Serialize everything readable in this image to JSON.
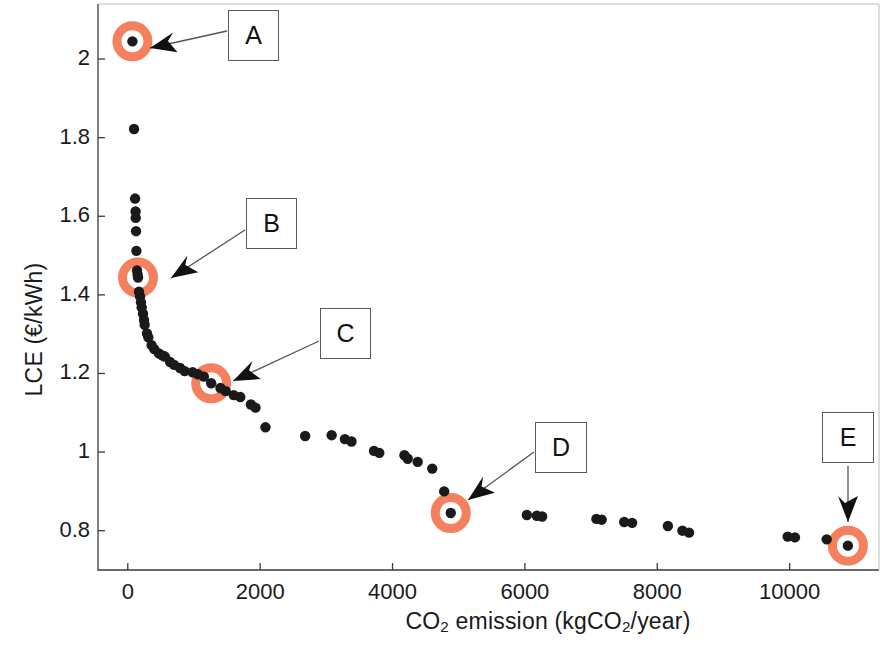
{
  "chart_data": {
    "type": "scatter",
    "title": "",
    "xlabel": "CO2 emission (kgCO2/year)",
    "ylabel": "LCE (€/kWh)",
    "xlabel_parts": {
      "pre": "CO",
      "sub1": "2",
      "mid": " emission (kgCO",
      "sub2": "2",
      "post": "/year)"
    },
    "ylabel_text": "LCE (€/kWh)",
    "xlim": [
      -450,
      11350
    ],
    "ylim": [
      0.7,
      2.14
    ],
    "xticks": [
      0,
      2000,
      4000,
      6000,
      8000,
      10000
    ],
    "xticklabels": [
      "0",
      "2000",
      "4000",
      "6000",
      "8000",
      "10000"
    ],
    "yticks": [
      0.8,
      1.0,
      1.2,
      1.4,
      1.6,
      1.8,
      2.0
    ],
    "yticklabels": [
      "0.8",
      "1",
      "1.2",
      "1.4",
      "1.6",
      "1.8",
      "2"
    ],
    "grid": false,
    "marker_color": "#1a1a1a",
    "highlight_color": "#F4805E",
    "legend": null,
    "series": [
      {
        "name": "Pareto front solutions",
        "marker": "filled-circle",
        "color": "#1a1a1a",
        "points": [
          [
            70,
            2.045
          ],
          [
            95,
            1.822
          ],
          [
            110,
            1.645
          ],
          [
            118,
            1.612
          ],
          [
            120,
            1.596
          ],
          [
            125,
            1.562
          ],
          [
            130,
            1.512
          ],
          [
            140,
            1.462
          ],
          [
            148,
            1.452
          ],
          [
            155,
            1.444
          ],
          [
            170,
            1.408
          ],
          [
            185,
            1.396
          ],
          [
            200,
            1.381
          ],
          [
            210,
            1.368
          ],
          [
            230,
            1.352
          ],
          [
            245,
            1.336
          ],
          [
            255,
            1.324
          ],
          [
            290,
            1.302
          ],
          [
            310,
            1.292
          ],
          [
            360,
            1.272
          ],
          [
            400,
            1.262
          ],
          [
            470,
            1.251
          ],
          [
            520,
            1.246
          ],
          [
            560,
            1.243
          ],
          [
            640,
            1.229
          ],
          [
            700,
            1.222
          ],
          [
            790,
            1.214
          ],
          [
            860,
            1.206
          ],
          [
            980,
            1.203
          ],
          [
            1060,
            1.198
          ],
          [
            1150,
            1.192
          ],
          [
            1260,
            1.175
          ],
          [
            1400,
            1.163
          ],
          [
            1480,
            1.155
          ],
          [
            1600,
            1.145
          ],
          [
            1700,
            1.14
          ],
          [
            1860,
            1.121
          ],
          [
            1930,
            1.113
          ],
          [
            2080,
            1.063
          ],
          [
            2680,
            1.041
          ],
          [
            3080,
            1.043
          ],
          [
            3280,
            1.033
          ],
          [
            3380,
            1.027
          ],
          [
            3720,
            1.003
          ],
          [
            3800,
            0.998
          ],
          [
            4180,
            0.992
          ],
          [
            4230,
            0.983
          ],
          [
            4380,
            0.975
          ],
          [
            4600,
            0.958
          ],
          [
            4780,
            0.9
          ],
          [
            4880,
            0.845
          ],
          [
            6030,
            0.84
          ],
          [
            6180,
            0.838
          ],
          [
            6260,
            0.836
          ],
          [
            7080,
            0.83
          ],
          [
            7160,
            0.828
          ],
          [
            7500,
            0.822
          ],
          [
            7620,
            0.82
          ],
          [
            8160,
            0.812
          ],
          [
            8380,
            0.8
          ],
          [
            8480,
            0.795
          ],
          [
            9970,
            0.785
          ],
          [
            10080,
            0.783
          ],
          [
            10560,
            0.778
          ],
          [
            10880,
            0.762
          ]
        ]
      }
    ],
    "highlighted_points": [
      {
        "label": "A",
        "x": 70,
        "y": 2.045
      },
      {
        "label": "B",
        "x": 155,
        "y": 1.444
      },
      {
        "label": "C",
        "x": 1260,
        "y": 1.175
      },
      {
        "label": "D",
        "x": 4880,
        "y": 0.845
      },
      {
        "label": "E",
        "x": 10880,
        "y": 0.762
      }
    ],
    "annotations": [
      {
        "label": "A",
        "target_x": 70,
        "target_y": 2.045
      },
      {
        "label": "B",
        "target_x": 155,
        "target_y": 1.444
      },
      {
        "label": "C",
        "target_x": 1260,
        "target_y": 1.175
      },
      {
        "label": "D",
        "target_x": 4880,
        "target_y": 0.845
      },
      {
        "label": "E",
        "target_x": 10880,
        "target_y": 0.762
      }
    ]
  },
  "axes": {
    "x_tick_labels": [
      "0",
      "2000",
      "4000",
      "6000",
      "8000",
      "10000"
    ],
    "y_tick_labels": [
      "0.8",
      "1",
      "1.2",
      "1.4",
      "1.6",
      "1.8",
      "2"
    ]
  },
  "labels": {
    "a": "A",
    "b": "B",
    "c": "C",
    "d": "D",
    "e": "E"
  },
  "xaxis_title": {
    "pre": "CO",
    "sub1": "2",
    "mid": " emission (kgCO",
    "sub2": "2",
    "post": "/year)"
  },
  "yaxis_title": "LCE (€/kWh)"
}
